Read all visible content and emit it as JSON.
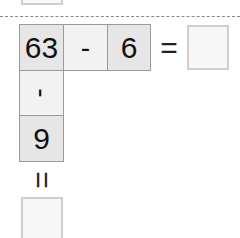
{
  "puzzle": {
    "row": {
      "first": "63",
      "operator": "-",
      "second": "6",
      "equals": "=",
      "answer": ""
    },
    "column": {
      "operator": "-",
      "second": "9",
      "equals": "=",
      "answer": ""
    }
  },
  "colors": {
    "shaded_cell": "#e6e6e6",
    "light_cell": "#f2f2f2",
    "border": "#9a9a9a",
    "answer_border": "#cfcfcf",
    "dash": "#888888"
  }
}
